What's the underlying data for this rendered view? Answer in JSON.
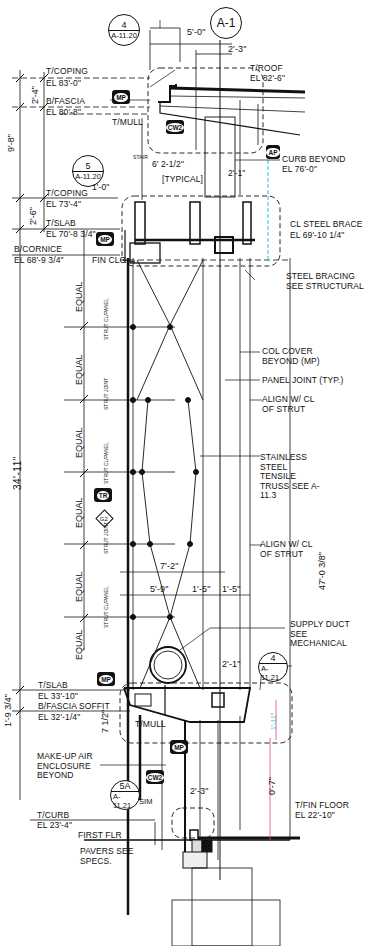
{
  "drawing": {
    "title_bubble": "A-1",
    "detail_callouts": [
      {
        "id": "callout-4-top",
        "number": "4",
        "sheet": "A-11.20"
      },
      {
        "id": "callout-5",
        "number": "5",
        "sheet": "A-11.20"
      },
      {
        "id": "callout-4-right",
        "number": "4",
        "sheet": "A-11.21"
      },
      {
        "id": "callout-5a",
        "number": "5A",
        "sheet": "A-11.21",
        "note": "SIM"
      }
    ],
    "elevations": [
      {
        "label": "T/COPING",
        "value": "EL 83'-0\""
      },
      {
        "label": "B/FASCIA",
        "value": "EL 80'-8\""
      },
      {
        "label": "T/MULL",
        "value": ""
      },
      {
        "label": "T/ROOF",
        "value": "EL 82'-6\""
      },
      {
        "label": "T/COPING",
        "value": "EL 73'-4\""
      },
      {
        "label": "T/SLAB",
        "value": "EL 70'-8 3/4\""
      },
      {
        "label": "B/CORNICE",
        "value": "EL 68'-9 3/4\""
      },
      {
        "label": "FIN CLG",
        "value": ""
      },
      {
        "label": "CL STEEL BRACE",
        "value": "EL 69'-10 1/4\""
      },
      {
        "label": "T/SLAB",
        "value": "EL 33'-10\""
      },
      {
        "label": "B/FASCIA",
        "value": "EL 32'-1/4\""
      },
      {
        "label": "SOFFIT",
        "value": ""
      },
      {
        "label": "T/MULL",
        "value": ""
      },
      {
        "label": "T/CURB",
        "value": "EL 23'-4\""
      },
      {
        "label": "FIRST FLR",
        "value": ""
      },
      {
        "label": "T/FIN FLOOR",
        "value": "EL 22'-10\""
      }
    ],
    "dimensions": {
      "top_width": "5'-0\"",
      "top_offset": "2'-3\"",
      "left_upper_total": "9'-8\"",
      "left_coping_fascia": "2'-4\"",
      "left_coping_slab": "2'-6\"",
      "stair_offset": "6' 2-1/2\"",
      "coping_offset": "1'-0\"",
      "right_upper_offset": "2'-1\"",
      "main_height": "34'-11\"",
      "right_total": "47'-0 3/8\"",
      "truss_width_a": "7'-2\"",
      "truss_width_b": "5'-9\"",
      "panel_a": "1'-5\"",
      "panel_b": "1'-5\"",
      "lower_offset": "2'-1\"",
      "slab_fascia": "1'-9 3/4\"",
      "fascia_mull": "7 1/2\"",
      "right_lower": "1'-11\"",
      "lower_height": "0'-7\"",
      "base_offset": "2'-3\"",
      "curb_drop": "6\"",
      "typical_note": "[TYPICAL]",
      "equal_label": "EQUAL"
    },
    "notes": [
      "CURB BEYOND",
      "EL 76'-0\"",
      "STEEL BRACING SEE STRUCTURAL",
      "COL COVER BEYOND (MP)",
      "PANEL JOINT (TYP.)",
      "ALIGN W/ CL OF STRUT",
      "STAINLESS STEEL TENSILE TRUSS SEE A-11.3",
      "ALIGN W/ CL OF STRUT",
      "SUPPLY DUCT SEE MECHANICAL",
      "MAKE-UP AIR ENCLOSURE BEYOND",
      "PAVERS SEE SPECS."
    ],
    "strut_tags": [
      "STRUT CL/PANEL",
      "STRUT JOINT",
      "STRUT CL/PANEL",
      "STRUT JOINT",
      "STRUT CL/PANEL",
      "STRUT JOINT",
      "STRUT CL/PANEL"
    ],
    "material_tags": {
      "mp": "MP",
      "cw2": "CW2",
      "tr": "TR",
      "g2": "G2",
      "ap": "AP"
    },
    "stair_label": "STAIR",
    "colors": {
      "line": "#111111",
      "bg": "#ffffff",
      "accent_pink": "#e0467a",
      "accent_cyan": "#27c2d4"
    }
  }
}
